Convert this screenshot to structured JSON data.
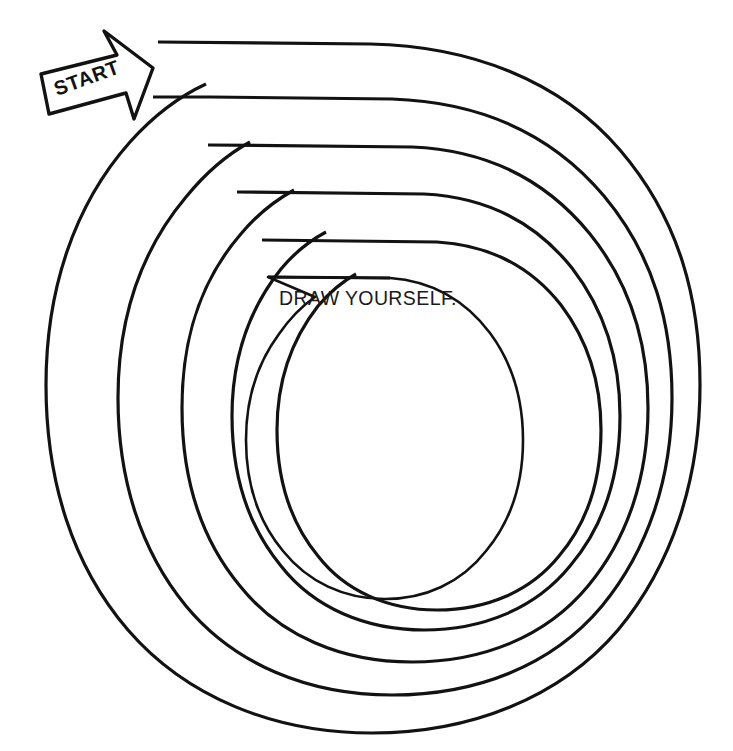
{
  "page": {
    "background_color": "#ffffff",
    "ink_color": "#121212",
    "width": 733,
    "height": 751
  },
  "artwork": {
    "type": "hand-drawn-spiral-maze",
    "description": "Five concentric spiral arms with flat top segments winding inward to an empty circle",
    "arm_count": 5,
    "line_color": "#121212",
    "stroke_widths": {
      "straight_top": 3.2,
      "curve": 2.1
    }
  },
  "start_marker": {
    "label": "START",
    "shape": "block-arrow",
    "direction": "right",
    "rotation_degrees": -20,
    "fill": "#ffffff",
    "stroke": "#121212"
  },
  "center_prompt": {
    "text": "DRAW YOURSELF.",
    "color": "#1a1a1a"
  },
  "spiral_geometry": {
    "center": {
      "x": 375,
      "y": 378
    },
    "arms": [
      {
        "index": 1,
        "start_x": 158,
        "start_y": 42,
        "left_x": 58,
        "right_x": 692,
        "bottom_y": 711
      },
      {
        "index": 2,
        "start_x": 153,
        "start_y": 97,
        "left_x": 102,
        "right_x": 645,
        "bottom_y": 662
      },
      {
        "index": 3,
        "start_x": 208,
        "start_y": 145,
        "left_x": 148,
        "right_x": 598,
        "bottom_y": 608
      },
      {
        "index": 4,
        "start_x": 237,
        "start_y": 192,
        "left_x": 192,
        "right_x": 552,
        "bottom_y": 565
      },
      {
        "index": 5,
        "start_x": 262,
        "start_y": 240,
        "left_x": 240,
        "right_x": 505,
        "bottom_y": 528
      },
      {
        "index": 6,
        "start_x": 268,
        "start_y": 277,
        "left_x": 266,
        "right_x": 500,
        "bottom_y": 520
      }
    ]
  }
}
